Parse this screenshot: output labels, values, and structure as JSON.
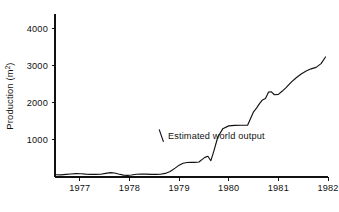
{
  "chart_data": {
    "type": "line",
    "title": "",
    "xlabel": "",
    "ylabel": "Production (m²)",
    "ylabel_base": "Production (m",
    "ylabel_unit": "2",
    "ylabel_close": ")",
    "xlim": [
      1976.5,
      1982.0
    ],
    "ylim": [
      0,
      4400
    ],
    "grid": false,
    "legend": "none",
    "y_ticks": [
      1000,
      2000,
      3000,
      4000
    ],
    "y_tick_labels": [
      "1000",
      "2000",
      "3000",
      "4000"
    ],
    "x_ticks": [
      1977,
      1978,
      1979,
      1980,
      1981,
      1982
    ],
    "x_tick_labels": [
      "1977",
      "1978",
      "1979",
      "1980",
      "1981",
      "1982"
    ],
    "annotations": [
      {
        "text": "Estimated world output",
        "x": 1979.75,
        "y": 1030
      }
    ],
    "series": [
      {
        "name": "Estimated world output",
        "color": "#111111",
        "x": [
          1976.52,
          1976.62,
          1976.72,
          1976.82,
          1976.92,
          1977.02,
          1977.12,
          1977.22,
          1977.32,
          1977.42,
          1977.52,
          1977.62,
          1977.7,
          1977.78,
          1977.88,
          1977.96,
          1978.04,
          1978.14,
          1978.24,
          1978.34,
          1978.44,
          1978.54,
          1978.62,
          1978.72,
          1978.82,
          1978.92,
          1979.0,
          1979.08,
          1979.16,
          1979.24,
          1979.32,
          1979.4,
          1979.46,
          1979.52,
          1979.58,
          1979.64,
          1979.7,
          1979.78,
          1979.88,
          1980.0,
          1980.12,
          1980.24,
          1980.32,
          1980.38,
          1980.44,
          1980.5,
          1980.56,
          1980.62,
          1980.68,
          1980.74,
          1980.8,
          1980.86,
          1980.92,
          1981.0,
          1981.08,
          1981.16,
          1981.26,
          1981.36,
          1981.46,
          1981.56,
          1981.66,
          1981.76,
          1981.86,
          1981.95
        ],
        "y": [
          60,
          58,
          70,
          82,
          92,
          88,
          78,
          72,
          70,
          74,
          96,
          118,
          108,
          80,
          52,
          44,
          54,
          74,
          82,
          78,
          72,
          70,
          74,
          96,
          150,
          240,
          320,
          370,
          392,
          398,
          396,
          404,
          470,
          530,
          560,
          440,
          700,
          1080,
          1300,
          1380,
          1392,
          1396,
          1396,
          1398,
          1580,
          1760,
          1860,
          1980,
          2080,
          2120,
          2290,
          2300,
          2220,
          2230,
          2320,
          2420,
          2560,
          2680,
          2780,
          2860,
          2920,
          2960,
          3060,
          3240
        ]
      }
    ]
  },
  "layout": {
    "plot_left_px": 55,
    "plot_right_px": 328,
    "plot_top_px": 14,
    "plot_bottom_px": 177
  }
}
